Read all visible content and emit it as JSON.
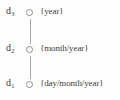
{
  "diagram": {
    "type": "temporal-granularity-lattice",
    "orientation": "vertical",
    "edge_color": "#a8a8a8",
    "node_stroke_color": "#8f8f8f",
    "text_color": "#3a3a3a",
    "background_color": "#fefefe",
    "nodes": [
      {
        "id": "d3",
        "var_letter": "d",
        "var_subscript": "3",
        "granularity": "{year}",
        "level": 3
      },
      {
        "id": "d2",
        "var_letter": "d",
        "var_subscript": "2",
        "granularity": "{month/year}",
        "level": 2
      },
      {
        "id": "d1",
        "var_letter": "d",
        "var_subscript": "1",
        "granularity": "{day/month/year}",
        "level": 1
      }
    ],
    "edges": [
      {
        "from": "d3",
        "to": "d2"
      },
      {
        "from": "d2",
        "to": "d1"
      }
    ]
  }
}
